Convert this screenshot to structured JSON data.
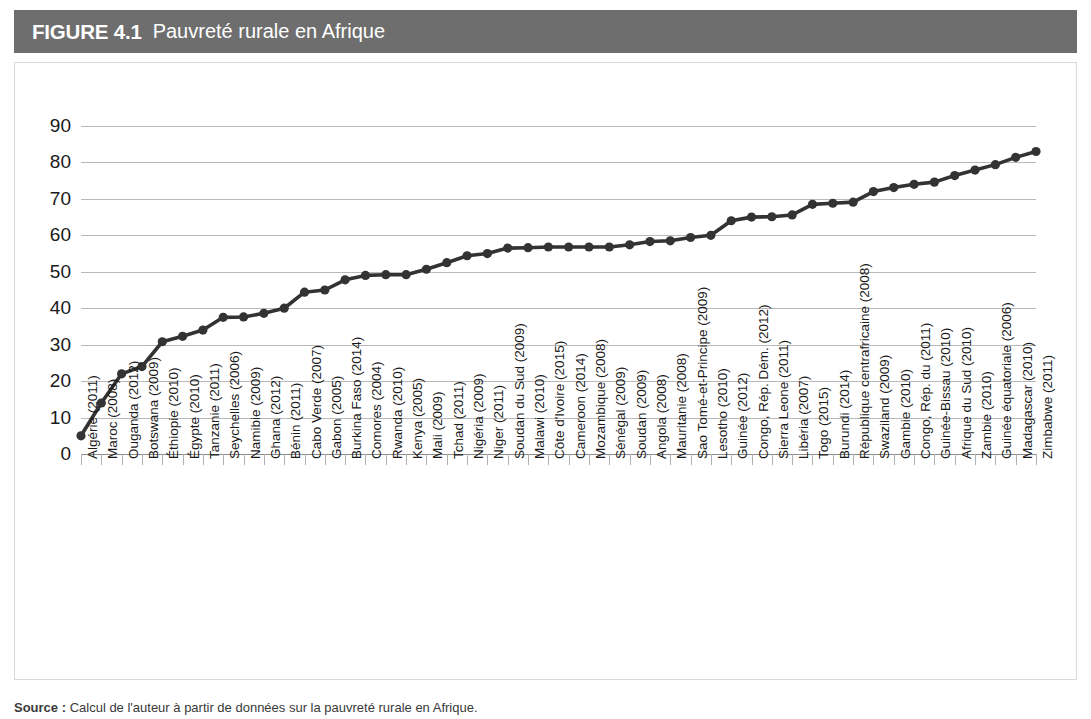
{
  "header": {
    "figure_number": "FIGURE 4.1",
    "title": "Pauvreté rurale en Afrique",
    "bar_color": "#6e6e6e"
  },
  "footer": {
    "source_label": "Source :",
    "source_text": "Calcul de l'auteur à partir de données sur la pauvreté rurale en Afrique."
  },
  "chart_data": {
    "type": "line",
    "title": "Pauvreté rurale en Afrique",
    "xlabel": "",
    "ylabel": "",
    "ylim": [
      0,
      90
    ],
    "ytick_step": 10,
    "ytick_labels": [
      "90",
      "80",
      "70",
      "60",
      "50",
      "40",
      "30",
      "20",
      "10",
      "0"
    ],
    "grid": true,
    "legend": "none",
    "marker": "circle",
    "series_color": "#333333",
    "categories": [
      "Algérie (2011)",
      "Maroc (2008)",
      "Ouganda (2012)",
      "Botswana (2009)",
      "Éthiopie (2010)",
      "Égypte (2010)",
      "Tanzanie (2011)",
      "Seychelles (2006)",
      "Namibie (2009)",
      "Ghana (2012)",
      "Bénin (2011)",
      "Cabo Verde (2007)",
      "Gabon (2005)",
      "Burkina Faso (2014)",
      "Comores (2004)",
      "Rwanda (2010)",
      "Kenya (2005)",
      "Mali (2009)",
      "Tchad (2011)",
      "Nigéria (2009)",
      "Niger (2011)",
      "Soudan du Sud (2009)",
      "Malawi (2010)",
      "Côte d'Ivoire (2015)",
      "Cameroon (2014)",
      "Mozambique (2008)",
      "Sénégal (2009)",
      "Soudan (2009)",
      "Angola (2008)",
      "Mauritanie (2008)",
      "Sao Tomé-et-Principe (2009)",
      "Lesotho (2010)",
      "Guinée (2012)",
      "Congo, Rép. Dém. (2012)",
      "Sierra Leone (2011)",
      "Libéria (2007)",
      "Togo (2015)",
      "Burundi (2014)",
      "République centrafricaine (2008)",
      "Swaziland (2009)",
      "Gambie (2010)",
      "Congo, Rép. du (2011)",
      "Guinée-Bissau (2010)",
      "Afrique du Sud (2010)",
      "Zambie (2010)",
      "Guinée équatoriale (2006)",
      "Madagascar (2010)",
      "Zimbabwe (2011)"
    ],
    "values": [
      5.0,
      14.0,
      22.0,
      24.0,
      30.8,
      32.3,
      34.0,
      37.5,
      37.6,
      38.6,
      40.0,
      44.4,
      45.0,
      47.8,
      49.0,
      49.2,
      49.2,
      50.7,
      52.5,
      54.4,
      55.0,
      56.5,
      56.6,
      56.8,
      56.8,
      56.8,
      56.8,
      57.4,
      58.3,
      58.5,
      59.4,
      60.0,
      64.0,
      65.0,
      65.1,
      65.6,
      68.5,
      68.8,
      69.1,
      72.0,
      73.1,
      74.0,
      74.6,
      76.4,
      77.9,
      79.4,
      81.4,
      83.0
    ]
  }
}
